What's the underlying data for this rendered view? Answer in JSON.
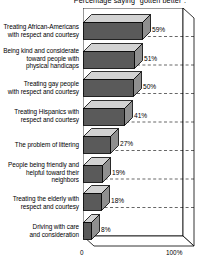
{
  "chart_data": {
    "type": "bar",
    "orientation": "horizontal",
    "title": "Percentage saying \"gotten better\".",
    "xlabel": "",
    "ylabel": "",
    "xlim": [
      0,
      100
    ],
    "grid": true,
    "legend": false,
    "categories": [
      "Treating African-Americans with respect and courtesy",
      "Being kind and considerate toward people with physical handicaps",
      "Treating gay people with respect and courtesy",
      "Treating Hispanics with respect and courtesy",
      "The problem of littering",
      "People being friendly and helpful toward their neighbors",
      "Treating the elderly with respect and courtesy",
      "Driving with care and consideration"
    ],
    "values": [
      59,
      51,
      50,
      41,
      27,
      19,
      18,
      8
    ],
    "value_labels": [
      "59%",
      "51%",
      "50%",
      "41%",
      "27%",
      "19%",
      "18%",
      "8%"
    ],
    "tick_labels": [
      "0",
      "100%"
    ],
    "colors": {
      "bar_front": "#5a5a5a",
      "bar_top": "#d2d2d2",
      "bar_side": "#8f8f8f",
      "outline": "#000000",
      "background": "#ffffff"
    }
  },
  "labels": {
    "lines": [
      [
        "Treating African-Americans",
        "with respect and courtesy"
      ],
      [
        "Being kind and considerate",
        "toward people with",
        "physical handicaps"
      ],
      [
        "Treating gay people",
        "with respect and courtesy"
      ],
      [
        "Treating Hispanics with",
        "respect and courtesy"
      ],
      [
        "The problem of littering"
      ],
      [
        "People being friendly and",
        "helpful toward their",
        "neighbors"
      ],
      [
        "Treating the elderly with",
        "respect and courtesy"
      ],
      [
        "Driving with care",
        "and consideration"
      ]
    ]
  }
}
